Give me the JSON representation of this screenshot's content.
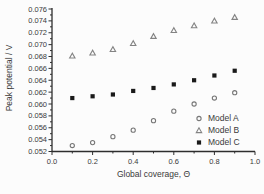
{
  "figure": {
    "background": "#fcfcfc",
    "text_color": "#3a3a3a",
    "axis_color": "#2e2e2e"
  },
  "chart_data": {
    "type": "scatter",
    "title": "",
    "xlabel": "Global coverage, Θ",
    "ylabel": "Peak potential / V",
    "xlim": [
      0.0,
      1.0
    ],
    "ylim": [
      0.052,
      0.076
    ],
    "grid": false,
    "legend_position": "inside lower right",
    "x_tick_labels": [
      "0.0",
      "0.2",
      "0.4",
      "0.6",
      "0.8",
      "1.0"
    ],
    "x_major_ticks": [
      0.0,
      0.2,
      0.4,
      0.6,
      0.8,
      1.0
    ],
    "x_minor_step": 0.1,
    "y_tick_labels": [
      "0.052",
      "0.054",
      "0.056",
      "0.058",
      "0.060",
      "0.062",
      "0.064",
      "0.066",
      "0.068",
      "0.070",
      "0.072",
      "0.074",
      "0.076"
    ],
    "y_major_ticks": [
      0.052,
      0.054,
      0.056,
      0.058,
      0.06,
      0.062,
      0.064,
      0.066,
      0.068,
      0.07,
      0.072,
      0.074,
      0.076
    ],
    "y_minor_step": 0.001,
    "x": [
      0.1,
      0.2,
      0.3,
      0.4,
      0.5,
      0.6,
      0.7,
      0.8,
      0.9
    ],
    "series": [
      {
        "name": "Model A",
        "marker": "circle-open",
        "color": "#777777",
        "values": [
          0.053,
          0.0535,
          0.0545,
          0.0556,
          0.0572,
          0.0588,
          0.06,
          0.061,
          0.0619
        ]
      },
      {
        "name": "Model B",
        "marker": "triangle-open",
        "color": "#838383",
        "values": [
          0.0681,
          0.0686,
          0.0692,
          0.0702,
          0.0714,
          0.0724,
          0.0732,
          0.074,
          0.0746
        ]
      },
      {
        "name": "Model C",
        "marker": "square-filled",
        "color": "#1a1a1a",
        "values": [
          0.061,
          0.0613,
          0.0616,
          0.0622,
          0.0627,
          0.0633,
          0.064,
          0.0648,
          0.0656
        ]
      }
    ]
  }
}
